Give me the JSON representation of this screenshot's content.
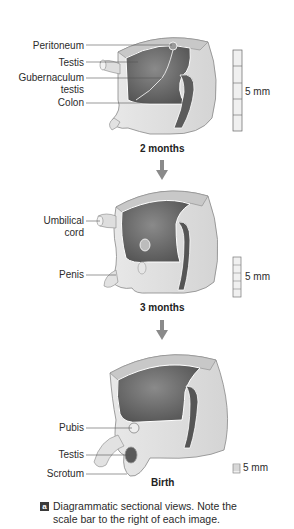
{
  "panels": [
    {
      "stage": "2 months",
      "labels": [
        "Peritoneum",
        "Testis",
        "Gubernaculum",
        "testis",
        "Colon"
      ],
      "scale_label": "5 mm"
    },
    {
      "stage": "3 months",
      "labels": [
        "Umbilical",
        "cord",
        "Penis"
      ],
      "scale_label": "5 mm"
    },
    {
      "stage": "Birth",
      "labels": [
        "Pubis",
        "Testis",
        "Scrotum"
      ],
      "scale_label": "5 mm"
    }
  ],
  "caption": {
    "badge": "a",
    "line1": "Diagrammatic sectional views. Note the",
    "line2": "scale bar to the right of each image."
  },
  "colors": {
    "tissue_light": "#e4e4e4",
    "tissue_mid": "#cfcfcf",
    "cavity_dark": "#6e6e6e",
    "arrow": "#888888"
  }
}
